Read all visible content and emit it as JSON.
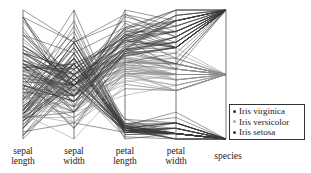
{
  "chart_data": {
    "type": "parallel_coordinates",
    "title": "",
    "axes": [
      {
        "name": "sepal length",
        "min": 4.3,
        "max": 7.9
      },
      {
        "name": "sepal width",
        "min": 2.0,
        "max": 4.4
      },
      {
        "name": "petal length",
        "min": 1.0,
        "max": 6.9
      },
      {
        "name": "petal width",
        "min": 0.1,
        "max": 2.5
      },
      {
        "name": "species",
        "categories": [
          "Iris setosa",
          "Iris versicolor",
          "Iris virginica"
        ]
      }
    ],
    "axis_labels": [
      {
        "line1": "sepal",
        "line2": "length"
      },
      {
        "line1": "sepal",
        "line2": "width"
      },
      {
        "line1": "petal",
        "line2": "length"
      },
      {
        "line1": "petal",
        "line2": "width"
      },
      {
        "line1": "species",
        "line2": ""
      }
    ],
    "legend": {
      "position": "lower right",
      "entries": [
        {
          "label": "Iris virginica",
          "color": "#333333"
        },
        {
          "label": "Iris versicolor",
          "color": "#999999"
        },
        {
          "label": "Iris setosa",
          "color": "#333333"
        }
      ]
    },
    "series_colors": {
      "Iris setosa": "#3a3a3a",
      "Iris versicolor": "#8c8c8c",
      "Iris virginica": "#3a3a3a"
    },
    "grid": false,
    "series": [
      {
        "name": "Iris setosa",
        "rows": [
          [
            5.1,
            3.5,
            1.4,
            0.2
          ],
          [
            4.9,
            3.0,
            1.4,
            0.2
          ],
          [
            4.7,
            3.2,
            1.3,
            0.2
          ],
          [
            4.6,
            3.1,
            1.5,
            0.2
          ],
          [
            5.0,
            3.6,
            1.4,
            0.2
          ],
          [
            5.4,
            3.9,
            1.7,
            0.4
          ],
          [
            4.6,
            3.4,
            1.4,
            0.3
          ],
          [
            5.0,
            3.4,
            1.5,
            0.2
          ],
          [
            4.4,
            2.9,
            1.4,
            0.2
          ],
          [
            4.9,
            3.1,
            1.5,
            0.1
          ],
          [
            5.4,
            3.7,
            1.5,
            0.2
          ],
          [
            4.8,
            3.4,
            1.6,
            0.2
          ],
          [
            4.8,
            3.0,
            1.4,
            0.1
          ],
          [
            4.3,
            3.0,
            1.1,
            0.1
          ],
          [
            5.8,
            4.0,
            1.2,
            0.2
          ],
          [
            5.7,
            4.4,
            1.5,
            0.4
          ],
          [
            5.4,
            3.9,
            1.3,
            0.4
          ],
          [
            5.1,
            3.5,
            1.4,
            0.3
          ],
          [
            5.7,
            3.8,
            1.7,
            0.3
          ],
          [
            5.1,
            3.8,
            1.5,
            0.3
          ],
          [
            5.4,
            3.4,
            1.7,
            0.2
          ],
          [
            5.1,
            3.7,
            1.5,
            0.4
          ],
          [
            4.6,
            3.6,
            1.0,
            0.2
          ],
          [
            5.1,
            3.3,
            1.7,
            0.5
          ],
          [
            4.8,
            3.4,
            1.9,
            0.2
          ],
          [
            5.0,
            3.0,
            1.6,
            0.2
          ],
          [
            5.0,
            3.4,
            1.6,
            0.4
          ],
          [
            5.2,
            3.5,
            1.5,
            0.2
          ],
          [
            5.2,
            3.4,
            1.4,
            0.2
          ],
          [
            4.7,
            3.2,
            1.6,
            0.2
          ],
          [
            4.8,
            3.1,
            1.6,
            0.2
          ],
          [
            5.4,
            3.4,
            1.5,
            0.4
          ],
          [
            5.2,
            4.1,
            1.5,
            0.1
          ],
          [
            5.5,
            4.2,
            1.4,
            0.2
          ],
          [
            4.9,
            3.1,
            1.5,
            0.2
          ],
          [
            5.0,
            3.2,
            1.2,
            0.2
          ],
          [
            5.5,
            3.5,
            1.3,
            0.2
          ],
          [
            4.9,
            3.6,
            1.4,
            0.1
          ],
          [
            4.4,
            3.0,
            1.3,
            0.2
          ],
          [
            5.1,
            3.4,
            1.5,
            0.2
          ],
          [
            5.0,
            3.5,
            1.3,
            0.3
          ],
          [
            4.5,
            2.3,
            1.3,
            0.3
          ],
          [
            4.4,
            3.2,
            1.3,
            0.2
          ],
          [
            5.0,
            3.5,
            1.6,
            0.6
          ],
          [
            5.1,
            3.8,
            1.9,
            0.4
          ],
          [
            4.8,
            3.0,
            1.4,
            0.3
          ],
          [
            5.1,
            3.8,
            1.6,
            0.2
          ],
          [
            4.6,
            3.2,
            1.4,
            0.2
          ],
          [
            5.3,
            3.7,
            1.5,
            0.2
          ],
          [
            5.0,
            3.3,
            1.4,
            0.2
          ]
        ]
      },
      {
        "name": "Iris versicolor",
        "rows": [
          [
            7.0,
            3.2,
            4.7,
            1.4
          ],
          [
            6.4,
            3.2,
            4.5,
            1.5
          ],
          [
            6.9,
            3.1,
            4.9,
            1.5
          ],
          [
            5.5,
            2.3,
            4.0,
            1.3
          ],
          [
            6.5,
            2.8,
            4.6,
            1.5
          ],
          [
            5.7,
            2.8,
            4.5,
            1.3
          ],
          [
            6.3,
            3.3,
            4.7,
            1.6
          ],
          [
            4.9,
            2.4,
            3.3,
            1.0
          ],
          [
            6.6,
            2.9,
            4.6,
            1.3
          ],
          [
            5.2,
            2.7,
            3.9,
            1.4
          ],
          [
            5.0,
            2.0,
            3.5,
            1.0
          ],
          [
            5.9,
            3.0,
            4.2,
            1.5
          ],
          [
            6.0,
            2.2,
            4.0,
            1.0
          ],
          [
            6.1,
            2.9,
            4.7,
            1.4
          ],
          [
            5.6,
            2.9,
            3.6,
            1.3
          ],
          [
            6.7,
            3.1,
            4.4,
            1.4
          ],
          [
            5.6,
            3.0,
            4.5,
            1.5
          ],
          [
            5.8,
            2.7,
            4.1,
            1.0
          ],
          [
            6.2,
            2.2,
            4.5,
            1.5
          ],
          [
            5.6,
            2.5,
            3.9,
            1.1
          ],
          [
            5.9,
            3.2,
            4.8,
            1.8
          ],
          [
            6.1,
            2.8,
            4.0,
            1.3
          ],
          [
            6.3,
            2.5,
            4.9,
            1.5
          ],
          [
            6.1,
            2.8,
            4.7,
            1.2
          ],
          [
            6.4,
            2.9,
            4.3,
            1.3
          ],
          [
            6.6,
            3.0,
            4.4,
            1.4
          ],
          [
            6.8,
            2.8,
            4.8,
            1.4
          ],
          [
            6.7,
            3.0,
            5.0,
            1.7
          ],
          [
            6.0,
            2.9,
            4.5,
            1.5
          ],
          [
            5.7,
            2.6,
            3.5,
            1.0
          ],
          [
            5.5,
            2.4,
            3.8,
            1.1
          ],
          [
            5.5,
            2.4,
            3.7,
            1.0
          ],
          [
            5.8,
            2.7,
            3.9,
            1.2
          ],
          [
            6.0,
            2.7,
            5.1,
            1.6
          ],
          [
            5.4,
            3.0,
            4.5,
            1.5
          ],
          [
            6.0,
            3.4,
            4.5,
            1.6
          ],
          [
            6.7,
            3.1,
            4.7,
            1.5
          ],
          [
            6.3,
            2.3,
            4.4,
            1.3
          ],
          [
            5.6,
            3.0,
            4.1,
            1.3
          ],
          [
            5.5,
            2.5,
            4.0,
            1.3
          ],
          [
            5.5,
            2.6,
            4.4,
            1.2
          ],
          [
            6.1,
            3.0,
            4.6,
            1.4
          ],
          [
            5.8,
            2.6,
            4.0,
            1.2
          ],
          [
            5.0,
            2.3,
            3.3,
            1.0
          ],
          [
            5.6,
            2.7,
            4.2,
            1.3
          ],
          [
            5.7,
            3.0,
            4.2,
            1.2
          ],
          [
            5.7,
            2.9,
            4.2,
            1.3
          ],
          [
            6.2,
            2.9,
            4.3,
            1.3
          ],
          [
            5.1,
            2.5,
            3.0,
            1.1
          ],
          [
            5.7,
            2.8,
            4.1,
            1.3
          ]
        ]
      },
      {
        "name": "Iris virginica",
        "rows": [
          [
            6.3,
            3.3,
            6.0,
            2.5
          ],
          [
            5.8,
            2.7,
            5.1,
            1.9
          ],
          [
            7.1,
            3.0,
            5.9,
            2.1
          ],
          [
            6.3,
            2.9,
            5.6,
            1.8
          ],
          [
            6.5,
            3.0,
            5.8,
            2.2
          ],
          [
            7.6,
            3.0,
            6.6,
            2.1
          ],
          [
            4.9,
            2.5,
            4.5,
            1.7
          ],
          [
            7.3,
            2.9,
            6.3,
            1.8
          ],
          [
            6.7,
            2.5,
            5.8,
            1.8
          ],
          [
            7.2,
            3.6,
            6.1,
            2.5
          ],
          [
            6.5,
            3.2,
            5.1,
            2.0
          ],
          [
            6.4,
            2.7,
            5.3,
            1.9
          ],
          [
            6.8,
            3.0,
            5.5,
            2.1
          ],
          [
            5.7,
            2.5,
            5.0,
            2.0
          ],
          [
            5.8,
            2.8,
            5.1,
            2.4
          ],
          [
            6.4,
            3.2,
            5.3,
            2.3
          ],
          [
            6.5,
            3.0,
            5.5,
            1.8
          ],
          [
            7.7,
            3.8,
            6.7,
            2.2
          ],
          [
            7.7,
            2.6,
            6.9,
            2.3
          ],
          [
            6.0,
            2.2,
            5.0,
            1.5
          ],
          [
            6.9,
            3.2,
            5.7,
            2.3
          ],
          [
            5.6,
            2.8,
            4.9,
            2.0
          ],
          [
            7.7,
            2.8,
            6.7,
            2.0
          ],
          [
            6.3,
            2.7,
            4.9,
            1.8
          ],
          [
            6.7,
            3.3,
            5.7,
            2.1
          ],
          [
            7.2,
            3.2,
            6.0,
            1.8
          ],
          [
            6.2,
            2.8,
            4.8,
            1.8
          ],
          [
            6.1,
            3.0,
            4.9,
            1.8
          ],
          [
            6.4,
            2.8,
            5.6,
            2.1
          ],
          [
            7.2,
            3.0,
            5.8,
            1.6
          ],
          [
            7.4,
            2.8,
            6.1,
            1.9
          ],
          [
            7.9,
            3.8,
            6.4,
            2.0
          ],
          [
            6.4,
            2.8,
            5.6,
            2.2
          ],
          [
            6.3,
            2.8,
            5.1,
            1.5
          ],
          [
            6.1,
            2.6,
            5.6,
            1.4
          ],
          [
            7.7,
            3.0,
            6.1,
            2.3
          ],
          [
            6.3,
            3.4,
            5.6,
            2.4
          ],
          [
            6.4,
            3.1,
            5.5,
            1.8
          ],
          [
            6.0,
            3.0,
            4.8,
            1.8
          ],
          [
            6.9,
            3.1,
            5.4,
            2.1
          ],
          [
            6.7,
            3.1,
            5.6,
            2.4
          ],
          [
            6.9,
            3.1,
            5.1,
            2.3
          ],
          [
            5.8,
            2.7,
            5.1,
            1.9
          ],
          [
            6.8,
            3.2,
            5.9,
            2.3
          ],
          [
            6.7,
            3.3,
            5.7,
            2.5
          ],
          [
            6.7,
            3.0,
            5.2,
            2.3
          ],
          [
            6.3,
            2.5,
            5.0,
            1.9
          ],
          [
            6.5,
            3.0,
            5.2,
            2.0
          ],
          [
            6.2,
            3.4,
            5.4,
            2.3
          ],
          [
            5.9,
            3.0,
            5.1,
            1.8
          ]
        ]
      }
    ]
  }
}
